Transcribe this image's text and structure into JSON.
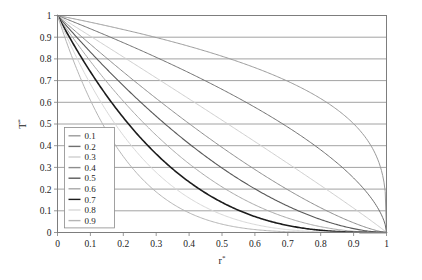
{
  "chart_data": {
    "type": "line",
    "title": "",
    "xlabel": "r*",
    "ylabel": "T*",
    "xlim": [
      0,
      1
    ],
    "ylim": [
      0,
      1
    ],
    "grid": true,
    "grid_axis": "y",
    "legend_position": "lower-left-inside",
    "xticks": [
      "0",
      "0.1",
      "0.2",
      "0.3",
      "0.4",
      "0.5",
      "0.6",
      "0.7",
      "0.8",
      "0.9",
      "1"
    ],
    "yticks": [
      "0",
      "0.1",
      "0.2",
      "0.3",
      "0.4",
      "0.5",
      "0.6",
      "0.7",
      "0.8",
      "0.9",
      "1"
    ],
    "xtick_values": [
      0,
      0.1,
      0.2,
      0.3,
      0.4,
      0.5,
      0.6,
      0.7,
      0.8,
      0.9,
      1
    ],
    "ytick_values": [
      0,
      0.1,
      0.2,
      0.3,
      0.4,
      0.5,
      0.6,
      0.7,
      0.8,
      0.9,
      1
    ],
    "convergence_point": [
      1,
      0
    ],
    "series": [
      {
        "name": "0.1",
        "color": "#9a9a9a",
        "width": 1.0,
        "exponent": 0.3,
        "x": [
          0.0,
          0.05,
          0.1,
          0.15,
          0.2,
          0.25,
          0.3,
          0.35,
          0.4,
          0.45,
          0.5,
          0.55,
          0.6,
          0.65,
          0.7,
          0.75,
          0.8,
          0.85,
          0.9,
          0.95,
          1.0
        ],
        "y": [
          1.0,
          0.985,
          0.969,
          0.953,
          0.935,
          0.917,
          0.897,
          0.877,
          0.854,
          0.83,
          0.804,
          0.775,
          0.743,
          0.707,
          0.666,
          0.618,
          0.561,
          0.49,
          0.398,
          0.265,
          0.0
        ]
      },
      {
        "name": "0.2",
        "color": "#6f6f6f",
        "width": 1.0,
        "exponent": 0.6,
        "x": [
          0.0,
          0.05,
          0.1,
          0.15,
          0.2,
          0.25,
          0.3,
          0.35,
          0.4,
          0.45,
          0.5,
          0.55,
          0.6,
          0.65,
          0.7,
          0.75,
          0.8,
          0.85,
          0.9,
          0.95,
          1.0
        ],
        "y": [
          1.0,
          0.97,
          0.939,
          0.908,
          0.875,
          0.842,
          0.807,
          0.77,
          0.732,
          0.692,
          0.66,
          0.607,
          0.558,
          0.505,
          0.449,
          0.389,
          0.324,
          0.252,
          0.172,
          0.078,
          0.0
        ]
      },
      {
        "name": "0.3",
        "color": "#cfcfcf",
        "width": 1.0,
        "exponent": 0.95,
        "x": [
          0.0,
          0.05,
          0.1,
          0.15,
          0.2,
          0.25,
          0.3,
          0.35,
          0.4,
          0.45,
          0.5,
          0.55,
          0.6,
          0.65,
          0.7,
          0.75,
          0.8,
          0.85,
          0.9,
          0.95,
          1.0
        ],
        "y": [
          1.0,
          0.953,
          0.905,
          0.857,
          0.809,
          0.761,
          0.713,
          0.665,
          0.617,
          0.569,
          0.521,
          0.473,
          0.425,
          0.376,
          0.328,
          0.279,
          0.23,
          0.18,
          0.13,
          0.073,
          0.0
        ]
      },
      {
        "name": "0.4",
        "color": "#8d8d8d",
        "width": 1.0,
        "exponent": 1.35,
        "x": [
          0.0,
          0.05,
          0.1,
          0.15,
          0.2,
          0.25,
          0.3,
          0.35,
          0.4,
          0.45,
          0.5,
          0.55,
          0.6,
          0.65,
          0.7,
          0.75,
          0.8,
          0.85,
          0.9,
          0.95,
          1.0
        ],
        "y": [
          1.0,
          0.934,
          0.87,
          0.806,
          0.744,
          0.683,
          0.623,
          0.564,
          0.507,
          0.451,
          0.397,
          0.344,
          0.293,
          0.244,
          0.197,
          0.153,
          0.112,
          0.074,
          0.04,
          0.014,
          0.0
        ]
      },
      {
        "name": "0.5",
        "color": "#5a5a5a",
        "width": 1.1,
        "exponent": 1.75,
        "x": [
          0.0,
          0.05,
          0.1,
          0.15,
          0.2,
          0.25,
          0.3,
          0.35,
          0.4,
          0.45,
          0.5,
          0.55,
          0.6,
          0.65,
          0.7,
          0.75,
          0.8,
          0.85,
          0.9,
          0.95,
          1.0
        ],
        "y": [
          1.0,
          0.915,
          0.835,
          0.757,
          0.683,
          0.612,
          0.545,
          0.481,
          0.42,
          0.363,
          0.309,
          0.259,
          0.212,
          0.17,
          0.131,
          0.096,
          0.066,
          0.04,
          0.02,
          0.006,
          0.0
        ]
      },
      {
        "name": "0.6",
        "color": "#a8a8a8",
        "width": 1.0,
        "exponent": 2.25,
        "x": [
          0.0,
          0.05,
          0.1,
          0.15,
          0.2,
          0.25,
          0.3,
          0.35,
          0.4,
          0.45,
          0.5,
          0.55,
          0.6,
          0.65,
          0.7,
          0.75,
          0.8,
          0.85,
          0.9,
          0.95,
          1.0
        ],
        "y": [
          1.0,
          0.893,
          0.793,
          0.701,
          0.614,
          0.534,
          0.46,
          0.392,
          0.33,
          0.273,
          0.222,
          0.176,
          0.136,
          0.102,
          0.072,
          0.048,
          0.029,
          0.015,
          0.006,
          0.001,
          0.0
        ]
      },
      {
        "name": "0.7",
        "color": "#1c1c1c",
        "width": 1.6,
        "exponent": 2.85,
        "x": [
          0.0,
          0.05,
          0.1,
          0.15,
          0.2,
          0.25,
          0.3,
          0.35,
          0.4,
          0.45,
          0.5,
          0.55,
          0.6,
          0.65,
          0.7,
          0.75,
          0.8,
          0.85,
          0.9,
          0.95,
          1.0
        ],
        "y": [
          1.0,
          0.868,
          0.748,
          0.64,
          0.543,
          0.456,
          0.379,
          0.311,
          0.252,
          0.2,
          0.156,
          0.118,
          0.086,
          0.06,
          0.04,
          0.024,
          0.013,
          0.006,
          0.002,
          0.0,
          0.0
        ]
      },
      {
        "name": "0.8",
        "color": "#d8d8d8",
        "width": 1.0,
        "exponent": 3.6,
        "x": [
          0.0,
          0.05,
          0.1,
          0.15,
          0.2,
          0.25,
          0.3,
          0.35,
          0.4,
          0.45,
          0.5,
          0.55,
          0.6,
          0.65,
          0.7,
          0.75,
          0.8,
          0.85,
          0.9,
          0.95,
          1.0
        ],
        "y": [
          1.0,
          0.837,
          0.694,
          0.57,
          0.463,
          0.371,
          0.294,
          0.229,
          0.175,
          0.131,
          0.095,
          0.066,
          0.044,
          0.028,
          0.016,
          0.009,
          0.004,
          0.001,
          0.0,
          0.0,
          0.0
        ]
      },
      {
        "name": "0.9",
        "color": "#b5b5b5",
        "width": 1.0,
        "exponent": 4.7,
        "x": [
          0.0,
          0.05,
          0.1,
          0.15,
          0.2,
          0.25,
          0.3,
          0.35,
          0.4,
          0.45,
          0.5,
          0.55,
          0.6,
          0.65,
          0.7,
          0.75,
          0.8,
          0.85,
          0.9,
          0.95,
          1.0
        ],
        "y": [
          1.0,
          0.792,
          0.618,
          0.475,
          0.359,
          0.266,
          0.193,
          0.136,
          0.093,
          0.061,
          0.038,
          0.023,
          0.012,
          0.006,
          0.003,
          0.001,
          0.0,
          0.0,
          0.0,
          0.0,
          0.0
        ]
      }
    ]
  },
  "legend": {
    "entries": [
      {
        "label": "0.1"
      },
      {
        "label": "0.2"
      },
      {
        "label": "0.3"
      },
      {
        "label": "0.4"
      },
      {
        "label": "0.5"
      },
      {
        "label": "0.6"
      },
      {
        "label": "0.7"
      },
      {
        "label": "0.8"
      },
      {
        "label": "0.9"
      }
    ]
  },
  "axes": {
    "x_title_base": "r",
    "x_title_sup": "*",
    "y_title_base": "T",
    "y_title_sup": "*"
  },
  "style": {
    "background": "#ffffff",
    "frame_color": "#7d7d7d",
    "grid_color": "#8a8a8a",
    "text_color": "#222222"
  }
}
